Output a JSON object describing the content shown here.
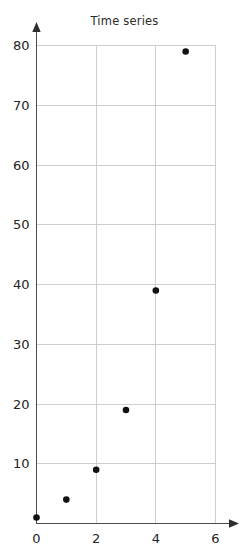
{
  "chart_data": {
    "type": "scatter",
    "title": "Time series",
    "xlabel": "",
    "ylabel": "",
    "x": [
      0,
      1,
      2,
      3,
      4,
      5
    ],
    "values": [
      1,
      4,
      9,
      19,
      39,
      79
    ],
    "points": [
      {
        "x": 0,
        "y": 1
      },
      {
        "x": 1,
        "y": 4
      },
      {
        "x": 2,
        "y": 9
      },
      {
        "x": 3,
        "y": 19
      },
      {
        "x": 4,
        "y": 39
      },
      {
        "x": 5,
        "y": 79
      }
    ],
    "xlim": [
      0,
      6
    ],
    "ylim": [
      0,
      80
    ],
    "x_ticks": [
      0,
      2,
      4,
      6
    ],
    "x_tick_labels": [
      "0",
      "2",
      "4",
      "6"
    ],
    "y_ticks": [
      10,
      20,
      30,
      40,
      50,
      60,
      70,
      80
    ],
    "y_tick_labels": [
      "10",
      "20",
      "30",
      "40",
      "50",
      "60",
      "70",
      "80"
    ],
    "grid": true,
    "legend": null,
    "marker": "circle",
    "marker_color": "#111111",
    "grid_color": "#c9c9c9",
    "axis_color": "#4a4a4a",
    "background_color": "#ffffff"
  },
  "axes": {
    "x_axis_name": "x-axis",
    "y_axis_name": "y-axis",
    "x_arrow": "right-arrow",
    "y_arrow": "up-arrow"
  }
}
